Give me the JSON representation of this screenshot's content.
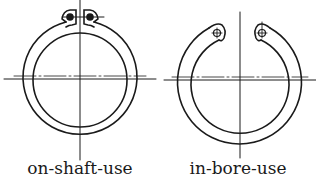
{
  "figures": [
    {
      "id": "on-shaft",
      "caption": "on-shaft-use",
      "type": "external retaining ring (circlip)",
      "center": [
        80,
        80
      ],
      "outer_radius": 57,
      "inner_radius": 47,
      "lugs": "top, with solid dot holes"
    },
    {
      "id": "in-bore",
      "caption": "in-bore-use",
      "type": "internal retaining ring (circlip)",
      "center": [
        239,
        80
      ],
      "outer_radius": 62,
      "inner_radius": 49,
      "lugs": "top inner, with crosshair holes"
    }
  ],
  "colors": {
    "line": "#1a1a1a",
    "background": "#ffffff"
  }
}
